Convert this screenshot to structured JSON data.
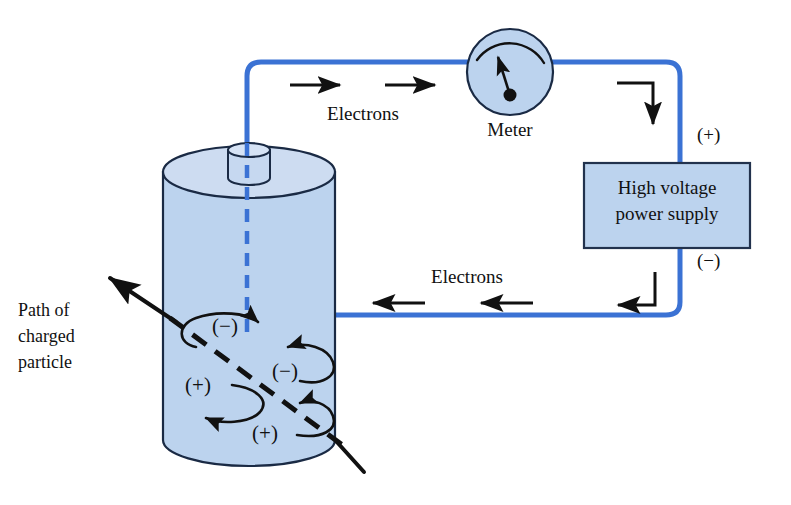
{
  "diagram": {
    "colors": {
      "wire_blue": "#3b72d4",
      "cylinder_fill": "#bcd3ee",
      "cylinder_stroke": "#1a2a44",
      "box_fill": "#bcd3ee",
      "box_stroke": "#22324d",
      "ink": "#111111",
      "background": "#ffffff"
    }
  },
  "labels": {
    "electrons_top": "Electrons",
    "electrons_bottom": "Electrons",
    "meter": "Meter",
    "path_line1": "Path of",
    "path_line2": "charged",
    "path_line3": "particle",
    "plus_terminal": "(+)",
    "minus_terminal": "(−)"
  },
  "power_supply": {
    "line1": "High voltage",
    "line2": "power supply"
  },
  "charges": [
    {
      "id": "charge-minus-upper-left",
      "text": "(−)"
    },
    {
      "id": "charge-minus-middle-right",
      "text": "(−)"
    },
    {
      "id": "charge-plus-lower-left",
      "text": "(+)"
    },
    {
      "id": "charge-plus-bottom-center",
      "text": "(+)"
    }
  ],
  "icons": {
    "meter_needle": "meter-needle-icon",
    "arrow_right": "arrow-right-icon",
    "arrow_left": "arrow-left-icon",
    "arrow_down_bent": "bent-arrow-down-icon",
    "arrow_left_bent": "bent-arrow-left-icon",
    "swirl": "charge-swirl-icon",
    "particle_path": "particle-path-arrow-icon"
  }
}
